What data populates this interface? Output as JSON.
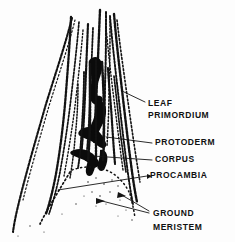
{
  "figure": {
    "style": "black ink stipple line drawing",
    "background_color": "#fdfdfd",
    "ink_color": "#0b0b0b",
    "width": 235,
    "height": 242
  },
  "labels": [
    {
      "id": "leaf-primordium",
      "line1": "LEAF",
      "line2": "PRIMORDIUM",
      "x": 148,
      "y1": 104,
      "y2": 116,
      "leader_from": [
        145,
        102
      ],
      "leader_to": [
        122,
        92
      ]
    },
    {
      "id": "protoderm",
      "line1": "PROTODERM",
      "line2": "",
      "x": 155,
      "y1": 143,
      "y2": 0,
      "leader_from": [
        152,
        143
      ],
      "leader_to": [
        108,
        137
      ]
    },
    {
      "id": "corpus",
      "line1": "CORPUS",
      "line2": "",
      "x": 155,
      "y1": 160,
      "y2": 0,
      "leader_from": [
        152,
        160
      ],
      "leader_to": [
        95,
        156
      ]
    },
    {
      "id": "procambia",
      "line1": "PROCAMBIA",
      "line2": "",
      "x": 150,
      "y1": 176,
      "y2": 0,
      "leader_from": [
        147,
        176
      ],
      "leader_to": [
        60,
        190
      ]
    },
    {
      "id": "ground-meristem",
      "line1": "GROUND",
      "line2": "MERISTEM",
      "x": 153,
      "y1": 214,
      "y2": 228,
      "leader_from": [
        150,
        212
      ],
      "leader_to": [
        118,
        196
      ]
    }
  ],
  "arrows": [
    {
      "id": "ground-meristem-arrow-upper",
      "from": [
        149,
        211
      ],
      "to": [
        119,
        194
      ]
    },
    {
      "id": "ground-meristem-arrow-lower",
      "from": [
        149,
        213
      ],
      "to": [
        97,
        200
      ]
    }
  ],
  "structures": [
    {
      "id": "outer-leaf-left",
      "kind": "stippled-contour"
    },
    {
      "id": "leaf-primordium-left",
      "kind": "stippled-contour"
    },
    {
      "id": "leaf-primordium-center",
      "kind": "stippled-contour"
    },
    {
      "id": "leaf-primordium-right",
      "kind": "stippled-contour"
    },
    {
      "id": "apical-dome",
      "kind": "dense-ink-mass"
    },
    {
      "id": "procambial-strands",
      "kind": "dense-vertical-strokes"
    },
    {
      "id": "ground-meristem-arc",
      "kind": "dotted-arc"
    }
  ]
}
